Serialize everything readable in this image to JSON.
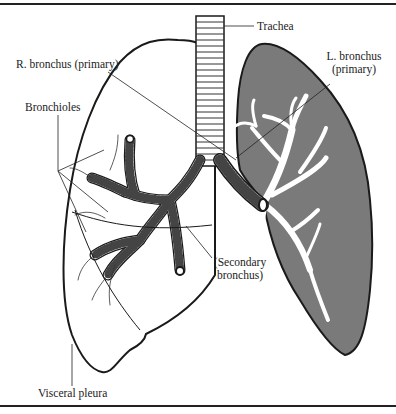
{
  "diagram": {
    "labels": {
      "trachea": "Trachea",
      "r_bronchus": "R. bronchus (primary)",
      "l_bronchus_line1": "L. bronchus",
      "l_bronchus_line2": "(primary)",
      "bronchioles": "Bronchioles",
      "secondary_line1": "(Secondary",
      "secondary_line2": "bronchus)",
      "visceral_pleura": "Visceral pleura"
    },
    "colors": {
      "outline": "#1a1a1a",
      "left_lung_fill": "#7a7a7a",
      "airway_fill": "#ffffff",
      "background": "#ffffff"
    }
  }
}
